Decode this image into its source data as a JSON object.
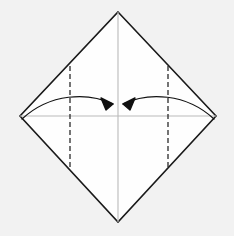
{
  "figure": {
    "canvas": {
      "width": 234,
      "height": 236
    },
    "background_color": "#f2f2f2",
    "paper_fill_color": "#fefefe"
  },
  "paper": {
    "name": "square-sheet-diamond",
    "outline_color": "#1a1a1a",
    "outline_width": 1.6,
    "vertices": {
      "top": {
        "x": 118,
        "y": 12
      },
      "right": {
        "x": 216,
        "y": 116
      },
      "bottom": {
        "x": 118,
        "y": 222
      },
      "left": {
        "x": 20,
        "y": 116
      }
    },
    "points_path": "118,12 216,116 118,222 20,116"
  },
  "creases": {
    "center_vertical": {
      "label": "vertical center crease",
      "color": "#b9b9b9",
      "width": 1.1,
      "style": "solid",
      "x1": 118,
      "y1": 12,
      "x2": 118,
      "y2": 222
    },
    "center_horizontal": {
      "label": "horizontal center crease",
      "color": "#b9b9b9",
      "width": 1.1,
      "style": "solid",
      "x1": 20,
      "y1": 116,
      "x2": 216,
      "y2": 116
    },
    "left_valley": {
      "label": "left vertical valley fold line",
      "color": "#2a2a2a",
      "width": 1.3,
      "style": "dashed",
      "dash_pattern": "5,3",
      "x1": 70,
      "y1": 66,
      "x2": 70,
      "y2": 167
    },
    "right_valley": {
      "label": "right vertical valley fold line",
      "color": "#2a2a2a",
      "width": 1.3,
      "style": "dashed",
      "dash_pattern": "5,3",
      "x1": 168,
      "y1": 66,
      "x2": 168,
      "y2": 167
    }
  },
  "arrows": {
    "color": "#111111",
    "width": 1.2,
    "left_fold_arrow": {
      "label": "fold left corner to center",
      "direction": "left-to-center",
      "path": "M 22,119 C 50,93 88,92 113,104"
    },
    "right_fold_arrow": {
      "label": "fold right corner to center",
      "direction": "right-to-center",
      "path": "M 214,119 C 186,93 148,92 123,104"
    },
    "left_arrowhead_points": "113,104 101,98 106,110",
    "right_arrowhead_points": "123,104 135,98 130,110"
  }
}
